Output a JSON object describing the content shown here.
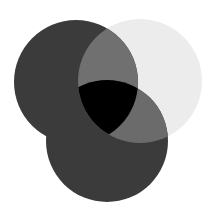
{
  "diagram": {
    "type": "venn",
    "sets": [
      {
        "name": "left-circle",
        "cx": 76,
        "cy": 82,
        "r": 62,
        "color": "#3b3b3b"
      },
      {
        "name": "top-right-circle",
        "cx": 140,
        "cy": 81,
        "r": 62,
        "color": "#ececec"
      },
      {
        "name": "bottom-circle",
        "cx": 107,
        "cy": 141,
        "r": 61,
        "color": "#3b3b3b"
      }
    ],
    "overlap_colors": {
      "left_and_right": "#707070",
      "bottom_and_right": "#6b6b6b",
      "left_and_bottom": "#3b3b3b",
      "all_three": "#000000"
    },
    "background": "#ffffff"
  }
}
